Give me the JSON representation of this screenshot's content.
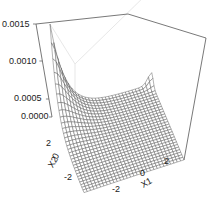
{
  "chart_data": {
    "type": "surface",
    "title": "",
    "xlabel": "X1",
    "ylabel": "X2",
    "zlabel": "",
    "x_ticks": [
      "-2",
      "0",
      "2"
    ],
    "y_ticks": [
      "-2",
      "0",
      "2"
    ],
    "z_ticks": [
      "0.0000",
      "0.0005",
      "0.0010",
      "0.0015"
    ],
    "xlim": [
      -3,
      3
    ],
    "ylim": [
      -3,
      3
    ],
    "zlim": [
      0,
      0.0015
    ],
    "grid": false,
    "surface": {
      "grid_size": 30,
      "peak": {
        "x1": -3,
        "x2": 3,
        "z": 0.0015
      },
      "secondary_peak": {
        "x1": 3,
        "x2": 3,
        "z": 0.00018
      }
    }
  },
  "colors": {
    "wire": "#555555",
    "box": "#555555",
    "back_wall": "#dddddd",
    "text": "#222222"
  }
}
